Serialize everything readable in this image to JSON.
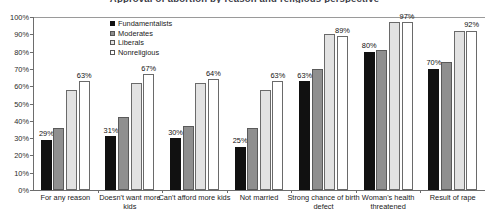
{
  "chart_data": {
    "type": "bar",
    "title": "Approval of abortion by reason and religious perspective",
    "xlabel": "",
    "ylabel": "",
    "ylim": [
      0,
      100
    ],
    "ytick_labels": [
      "100%",
      "90%",
      "80%",
      "70%",
      "60%",
      "50%",
      "40%",
      "30%",
      "20%",
      "10%",
      "0%"
    ],
    "ytick_values": [
      100,
      90,
      80,
      70,
      60,
      50,
      40,
      30,
      20,
      10,
      0
    ],
    "grid": false,
    "legend_position": "top-center-inside",
    "categories": [
      "For any reason",
      "Doesn't want more kids",
      "Can't afford more kids",
      "Not married",
      "Strong chance of birth defect",
      "Woman's health threatened",
      "Result of rape"
    ],
    "series": [
      {
        "name": "Fundamentalists",
        "color": "#111111",
        "values": [
          29,
          31,
          30,
          25,
          63,
          80,
          70
        ],
        "labels": [
          "29%",
          "31%",
          "30%",
          "25%",
          "63%",
          "80%",
          "70%"
        ]
      },
      {
        "name": "Moderates",
        "color": "#8f8f8f",
        "values": [
          36,
          42,
          37,
          36,
          70,
          81,
          74
        ],
        "labels": [
          "",
          "",
          "",
          "",
          "",
          "",
          ""
        ]
      },
      {
        "name": "Liberals",
        "color": "#e2e2e2",
        "values": [
          58,
          62,
          62,
          58,
          90,
          97,
          92
        ],
        "labels": [
          "",
          "",
          "",
          "",
          "",
          "",
          ""
        ]
      },
      {
        "name": "Nonreligious",
        "color": "#ffffff",
        "values": [
          63,
          67,
          64,
          63,
          89,
          97,
          92
        ],
        "labels": [
          "63%",
          "67%",
          "64%",
          "63%",
          "89%",
          "97%",
          "92%"
        ]
      }
    ]
  }
}
